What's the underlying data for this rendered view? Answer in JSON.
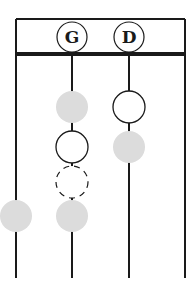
{
  "diagram": {
    "type": "string-fingering-chart",
    "header_labels": [
      {
        "string_index": 1,
        "text": "G"
      },
      {
        "string_index": 2,
        "text": "D"
      }
    ],
    "strings": 4,
    "markers": [
      {
        "string_index": 1,
        "position": 1,
        "style": "filled-grey"
      },
      {
        "string_index": 1,
        "position": 2,
        "style": "open"
      },
      {
        "string_index": 1,
        "position": 3,
        "style": "dashed"
      },
      {
        "string_index": 1,
        "position": 4,
        "style": "filled-grey"
      },
      {
        "string_index": 2,
        "position": 1,
        "style": "open"
      },
      {
        "string_index": 2,
        "position": 2,
        "style": "filled-grey"
      },
      {
        "string_index": 0,
        "position": 4,
        "style": "filled-grey"
      }
    ],
    "colors": {
      "line": "#1a1a1a",
      "filled": "#dcdcdc",
      "open": "#ffffff"
    }
  }
}
